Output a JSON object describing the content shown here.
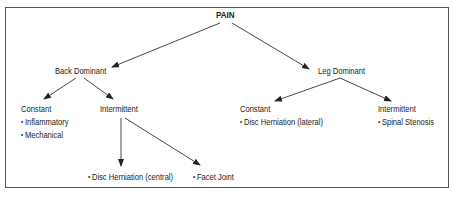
{
  "diagram": {
    "root": {
      "label": "PAIN"
    },
    "branches": [
      {
        "label": "Back Dominant",
        "children": [
          {
            "label": "Constant",
            "items": [
              "Inflammatory",
              "Mechanical"
            ]
          },
          {
            "label": "Intermittent",
            "items": [
              "Disc Herniation (central)",
              "Facet Joint"
            ]
          }
        ]
      },
      {
        "label": "Leg Dominant",
        "children": [
          {
            "label": "Constant",
            "items": [
              "Disc Herniation (lateral)"
            ]
          },
          {
            "label": "Intermittent",
            "items": [
              "Spinal Stenosis"
            ]
          }
        ]
      }
    ],
    "colors": {
      "line": "#333333",
      "border": "#555555",
      "text": "#222222"
    }
  }
}
